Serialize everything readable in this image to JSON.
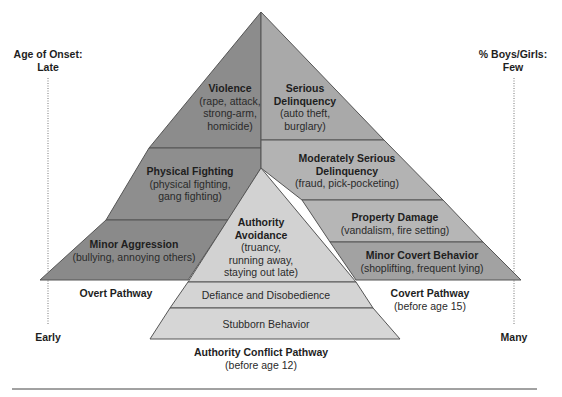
{
  "axes": {
    "left_top": {
      "line1": "Age of Onset:",
      "line2": "Late"
    },
    "left_bottom": "Early",
    "right_top": {
      "line1": "% Boys/Girls:",
      "line2": "Few"
    },
    "right_bottom": "Many"
  },
  "overt": {
    "violence": {
      "title": "Violence",
      "desc1": "(rape, attack,",
      "desc2": "strong-arm,",
      "desc3": "homicide)"
    },
    "physical": {
      "title": "Physical Fighting",
      "desc1": "(physical fighting,",
      "desc2": "gang fighting)"
    },
    "minor": {
      "title": "Minor Aggression",
      "desc1": "(bullying, annoying others)"
    },
    "pathway": "Overt Pathway"
  },
  "covert": {
    "serious": {
      "title1": "Serious",
      "title2": "Delinquency",
      "desc1": "(auto theft,",
      "desc2": "burglary)"
    },
    "moderate": {
      "title1": "Moderately Serious",
      "title2": "Delinquency",
      "desc1": "(fraud, pick-pocketing)"
    },
    "property": {
      "title": "Property Damage",
      "desc1": "(vandalism, fire setting)"
    },
    "minor": {
      "title": "Minor Covert Behavior",
      "desc1": "(shoplifting, frequent lying)"
    },
    "pathway": "Covert Pathway",
    "pathway_sub": "(before age 15)"
  },
  "authority": {
    "avoidance": {
      "title1": "Authority",
      "title2": "Avoidance",
      "desc1": "(truancy,",
      "desc2": "running away,",
      "desc3": "staying out late)"
    },
    "defiance": "Defiance and Disobedience",
    "stubborn": "Stubborn Behavior",
    "pathway": "Authority Conflict Pathway",
    "pathway_sub": "(before age 12)"
  },
  "colors": {
    "overt_fill": "#8c8c8c",
    "covert_serious": "#a9a9a9",
    "covert_moderate": "#b3b3b3",
    "covert_property": "#b6b6b6",
    "covert_minor": "#a2a2a2",
    "authority_fill": "#d2d2d2",
    "stroke": "#555555"
  }
}
